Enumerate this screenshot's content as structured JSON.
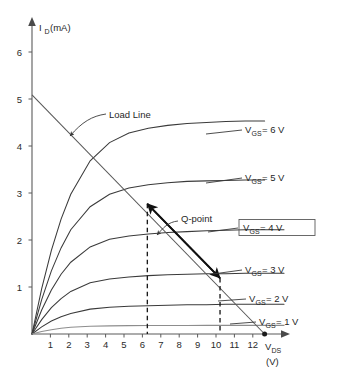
{
  "figure": {
    "background_color": "#ffffff",
    "curve_color": "#3a3a3a",
    "loadline_color": "#585858",
    "accent_color": "#111111"
  },
  "axes": {
    "y_axis_label_main": "I",
    "y_axis_label_sub": "D",
    "y_axis_label_unit": "(mA)",
    "x_axis_label_main": "V",
    "x_axis_label_sub": "DS",
    "x_axis_label_unit": "(V)",
    "y_ticks": [
      "1",
      "2",
      "3",
      "4",
      "5",
      "6"
    ],
    "x_ticks": [
      "1",
      "2",
      "3",
      "4",
      "5",
      "6",
      "7",
      "8",
      "9",
      "10",
      "11",
      "12"
    ]
  },
  "annotations": {
    "load_line": "Load Line",
    "q_point": "Q-point",
    "vgs_prefix": "V",
    "vgs_sub": "GS",
    "curve_labels": [
      {
        "eq": "= 6 V",
        "boxed": false
      },
      {
        "eq": "= 5 V",
        "boxed": false
      },
      {
        "eq": "= 4 V",
        "boxed": true
      },
      {
        "eq": "= 3 V",
        "boxed": false
      },
      {
        "eq": "= 2 V",
        "boxed": false
      },
      {
        "eq": "= 1 V",
        "boxed": false
      }
    ]
  },
  "chart_data": {
    "type": "line",
    "title": "",
    "xlabel": "V_DS (V)",
    "ylabel": "I_D (mA)",
    "xlim": [
      0,
      13
    ],
    "ylim": [
      0,
      6.5
    ],
    "grid": false,
    "legend": "inline-right-labels",
    "series": [
      {
        "name": "V_GS = 6 V",
        "saturation_current_mA": 4.45,
        "knee_vds_V": 4.0,
        "x": [
          0,
          0.5,
          1,
          1.5,
          2,
          3,
          4,
          5,
          6,
          7,
          8,
          9,
          10,
          11,
          12
        ],
        "y": [
          0,
          0.95,
          1.75,
          2.4,
          2.92,
          3.62,
          4.0,
          4.2,
          4.3,
          4.36,
          4.4,
          4.42,
          4.44,
          4.45,
          4.45
        ]
      },
      {
        "name": "V_GS = 5 V",
        "saturation_current_mA": 3.22,
        "knee_vds_V": 3.6,
        "x": [
          0,
          0.5,
          1,
          1.5,
          2,
          3,
          4,
          5,
          6,
          7,
          8,
          9,
          10,
          11,
          12
        ],
        "y": [
          0,
          0.72,
          1.32,
          1.8,
          2.18,
          2.66,
          2.92,
          3.05,
          3.12,
          3.16,
          3.19,
          3.2,
          3.21,
          3.22,
          3.22
        ]
      },
      {
        "name": "V_GS = 4 V",
        "saturation_current_mA": 2.18,
        "knee_vds_V": 3.2,
        "x": [
          0,
          0.5,
          1,
          1.5,
          2,
          3,
          4,
          5,
          6,
          7,
          8,
          9,
          10,
          11,
          12,
          13
        ],
        "y": [
          0,
          0.5,
          0.92,
          1.25,
          1.5,
          1.82,
          1.98,
          2.05,
          2.09,
          2.12,
          2.14,
          2.16,
          2.17,
          2.18,
          2.18,
          2.18
        ]
      },
      {
        "name": "V_GS = 3 V",
        "saturation_current_mA": 1.27,
        "knee_vds_V": 2.8,
        "x": [
          0,
          0.5,
          1,
          1.5,
          2,
          3,
          4,
          5,
          6,
          7,
          8,
          9,
          10,
          11,
          12,
          13
        ],
        "y": [
          0,
          0.3,
          0.55,
          0.74,
          0.89,
          1.07,
          1.15,
          1.19,
          1.22,
          1.24,
          1.25,
          1.26,
          1.26,
          1.27,
          1.27,
          1.27
        ]
      },
      {
        "name": "V_GS = 2 V",
        "saturation_current_mA": 0.62,
        "knee_vds_V": 2.4,
        "x": [
          0,
          0.5,
          1,
          1.5,
          2,
          3,
          4,
          5,
          6,
          7,
          8,
          9,
          10,
          11,
          12,
          13
        ],
        "y": [
          0,
          0.15,
          0.27,
          0.36,
          0.43,
          0.52,
          0.56,
          0.58,
          0.59,
          0.6,
          0.61,
          0.61,
          0.62,
          0.62,
          0.62,
          0.62
        ]
      },
      {
        "name": "V_GS = 1 V",
        "saturation_current_mA": 0.18,
        "knee_vds_V": 1.6,
        "x": [
          0,
          0.5,
          1,
          1.5,
          2,
          3,
          4,
          5,
          6,
          7,
          8,
          9,
          10,
          11,
          12,
          13
        ],
        "y": [
          0,
          0.05,
          0.09,
          0.12,
          0.14,
          0.16,
          0.17,
          0.175,
          0.177,
          0.178,
          0.179,
          0.18,
          0.18,
          0.18,
          0.18,
          0.18
        ]
      }
    ],
    "load_line": {
      "name": "Load Line",
      "y_intercept_mA": 5.0,
      "x_intercept_V": 12.0,
      "endpoint_marker_at_V": 12.0
    },
    "q_point_segment": {
      "upper_point": {
        "vds_V": 5.95,
        "id_mA": 2.72
      },
      "lower_point": {
        "vds_V": 9.7,
        "id_mA": 1.17
      },
      "q_point": {
        "vds_V": 7.8,
        "id_mA": 1.95
      },
      "dashed_verticals_at_V": [
        5.95,
        9.7
      ]
    }
  }
}
